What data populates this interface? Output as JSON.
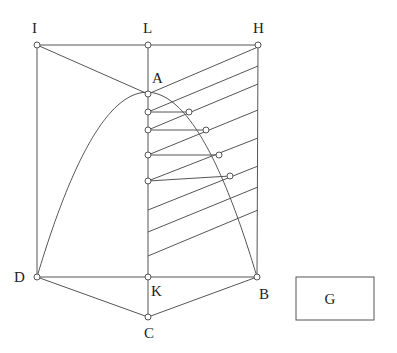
{
  "diagram": {
    "colors": {
      "line": "#555555",
      "text": "#222222",
      "background": "#ffffff"
    },
    "points": {
      "I": {
        "label": "I",
        "x": 37,
        "y": 45,
        "lx": 32,
        "ly": 33
      },
      "L": {
        "label": "L",
        "x": 148,
        "y": 45,
        "lx": 143,
        "ly": 33
      },
      "H": {
        "label": "H",
        "x": 258,
        "y": 45,
        "lx": 253,
        "ly": 33
      },
      "A": {
        "label": "A",
        "x": 148,
        "y": 94,
        "lx": 152,
        "ly": 83
      },
      "D": {
        "label": "D",
        "x": 37,
        "y": 277,
        "lx": 14,
        "ly": 282
      },
      "K": {
        "label": "K",
        "x": 148,
        "y": 277,
        "lx": 151,
        "ly": 296
      },
      "B": {
        "label": "B",
        "x": 257,
        "y": 277,
        "lx": 259,
        "ly": 299
      },
      "C": {
        "label": "C",
        "x": 148,
        "y": 317,
        "lx": 144,
        "ly": 338
      }
    },
    "g_box": {
      "label": "G",
      "x": 296,
      "y": 277,
      "width": 78,
      "height": 43,
      "lx": 330,
      "ly": 304
    },
    "axis_points": [
      {
        "x": 148,
        "y": 112
      },
      {
        "x": 148,
        "y": 130
      },
      {
        "x": 148,
        "y": 155
      },
      {
        "x": 148,
        "y": 181
      }
    ],
    "curve_points": [
      {
        "x": 189,
        "y": 112
      },
      {
        "x": 206,
        "y": 130
      },
      {
        "x": 219,
        "y": 155
      },
      {
        "x": 230,
        "y": 176
      }
    ],
    "slanted_lines": [
      {
        "y_left": 94,
        "y_right": 47
      },
      {
        "y_left": 112,
        "y_right": 66
      },
      {
        "y_left": 130,
        "y_right": 84
      },
      {
        "y_left": 155,
        "y_right": 110
      },
      {
        "y_left": 181,
        "y_right": 138
      },
      {
        "y_left": 210,
        "y_right": 166
      },
      {
        "y_left": 232,
        "y_right": 187
      },
      {
        "y_left": 256,
        "y_right": 210
      }
    ],
    "curve": {
      "from": "D",
      "apex": "A",
      "to": "B"
    }
  }
}
